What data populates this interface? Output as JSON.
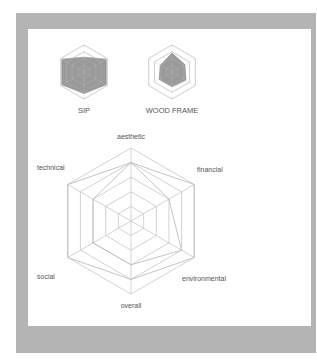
{
  "page": {
    "frame_color": "#b4b4b4",
    "panel_color": "#ffffff",
    "grid_color": "#c6c6c6",
    "fill_color": "#9a9a9a"
  },
  "chart_data": [
    {
      "type": "radar",
      "title": "SIP",
      "axes": [
        "aesthetic",
        "financial",
        "environmental",
        "overall",
        "social",
        "technical"
      ],
      "grid_levels": 4,
      "values": [
        0.55,
        0.95,
        0.95,
        0.8,
        0.95,
        0.95
      ],
      "range": [
        0,
        1
      ]
    },
    {
      "type": "radar",
      "title": "WOOD FRAME",
      "axes": [
        "aesthetic",
        "financial",
        "environmental",
        "overall",
        "social",
        "technical"
      ],
      "grid_levels": 4,
      "values": [
        0.7,
        0.55,
        0.6,
        0.55,
        0.55,
        0.5
      ],
      "range": [
        0,
        1
      ]
    },
    {
      "type": "radar",
      "title": "",
      "axes": [
        "aesthetic",
        "financial",
        "environmental",
        "overall",
        "social",
        "technical"
      ],
      "grid_levels": 5,
      "series": [
        {
          "name": "SIP",
          "values": [
            0.8,
            1.0,
            1.0,
            0.8,
            1.0,
            1.0
          ]
        },
        {
          "name": "WOOD FRAME",
          "values": [
            0.8,
            0.6,
            0.8,
            0.6,
            0.6,
            0.6
          ]
        }
      ],
      "range": [
        0,
        1
      ]
    }
  ],
  "labels": {
    "sip": "SIP",
    "wood_frame": "WOOD FRAME",
    "aesthetic": "aesthetic",
    "financial": "financial",
    "environmental": "environmental",
    "overall": "overall",
    "social": "social",
    "technical": "technical"
  }
}
